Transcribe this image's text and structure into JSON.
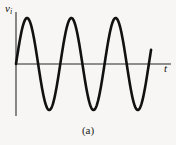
{
  "figure": {
    "caption": "(a)",
    "background_color": "#f7f6f4",
    "ink_color": "#111111",
    "axis_color": "#6b6b6b"
  },
  "labels": {
    "y_axis_symbol": "v",
    "y_axis_subscript": "i",
    "x_axis_symbol": "t"
  },
  "chart_data": {
    "type": "line",
    "title": "",
    "subtitle": "",
    "xlabel": "t",
    "ylabel": "v_i",
    "grid": false,
    "legend": null,
    "annotations": [
      "(a)"
    ],
    "waveform": "sine",
    "cycles": 3.5,
    "amplitude": 1.0,
    "phase_deg": 0,
    "offset": 0,
    "xlim": [
      0,
      3.5
    ],
    "ylim": [
      -1.15,
      1.15
    ],
    "x_unit": "periods",
    "peaks": [
      {
        "x": 0.25,
        "y": 1.0
      },
      {
        "x": 1.25,
        "y": 1.0
      },
      {
        "x": 2.25,
        "y": 1.0
      }
    ],
    "troughs": [
      {
        "x": 0.75,
        "y": -1.0
      },
      {
        "x": 1.75,
        "y": -1.0
      },
      {
        "x": 2.75,
        "y": -1.0
      }
    ],
    "zero_crossings": [
      0,
      0.5,
      1.0,
      1.5,
      2.0,
      2.5,
      3.0
    ],
    "x": [
      0,
      0.0625,
      0.125,
      0.1875,
      0.25,
      0.3125,
      0.375,
      0.4375,
      0.5,
      0.5625,
      0.625,
      0.6875,
      0.75,
      0.8125,
      0.875,
      0.9375,
      1.0,
      1.0625,
      1.125,
      1.1875,
      1.25,
      1.3125,
      1.375,
      1.4375,
      1.5,
      1.5625,
      1.625,
      1.6875,
      1.75,
      1.8125,
      1.875,
      1.9375,
      2.0,
      2.0625,
      2.125,
      2.1875,
      2.25,
      2.3125,
      2.375,
      2.4375,
      2.5,
      2.5625,
      2.625,
      2.6875,
      2.75,
      2.8125,
      2.875,
      2.9375,
      3.0,
      3.05
    ],
    "y": [
      0,
      0.383,
      0.707,
      0.924,
      1.0,
      0.924,
      0.707,
      0.383,
      0,
      -0.383,
      -0.707,
      -0.924,
      -1.0,
      -0.924,
      -0.707,
      -0.383,
      0,
      0.383,
      0.707,
      0.924,
      1.0,
      0.924,
      0.707,
      0.383,
      0,
      -0.383,
      -0.707,
      -0.924,
      -1.0,
      -0.924,
      -0.707,
      -0.383,
      0,
      0.383,
      0.707,
      0.924,
      1.0,
      0.924,
      0.707,
      0.383,
      0,
      -0.383,
      -0.707,
      -0.924,
      -1.0,
      -0.924,
      -0.707,
      -0.383,
      0,
      0.12
    ]
  }
}
